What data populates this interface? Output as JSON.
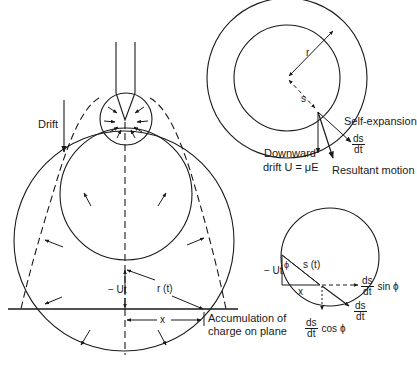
{
  "figure": {
    "left_panel": {
      "drift_label": "Drift",
      "minus_ut_label": "− Ut",
      "radius_label": "r (t)",
      "x_label": "x",
      "accumulation_label_line1": "Accumulation of",
      "accumulation_label_line2": "charge on plane"
    },
    "top_right_panel": {
      "r_label": "r",
      "s_label": "s",
      "self_expansion_label": "Self-expansion",
      "ds_dt": {
        "num": "ds",
        "den": "dt"
      },
      "downward_label_line1": "Downward",
      "downward_label_line2": "drift U = μE",
      "resultant_label": "Resultant motion"
    },
    "bottom_right_panel": {
      "minus_ut_label": "− Ut",
      "phi_label": "ϕ",
      "s_t_label": "s (t)",
      "x_label": "x",
      "sin_component": {
        "num": "ds",
        "den": "dt",
        "suffix": "sin ϕ"
      },
      "resultant": {
        "num": "ds",
        "den": "dt"
      },
      "cos_component": {
        "num": "ds",
        "den": "dt",
        "suffix": "cos ϕ"
      }
    }
  },
  "colors": {
    "stroke": "#1a1a1a",
    "background": "#ffffff"
  }
}
